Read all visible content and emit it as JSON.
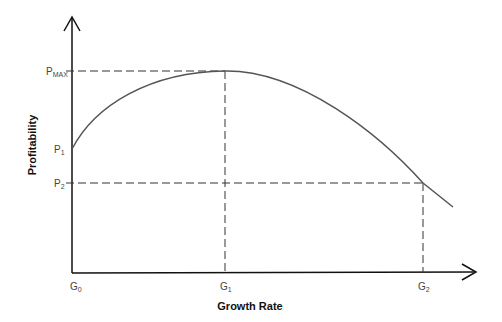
{
  "diagram": {
    "x_axis": {
      "title": "Growth Rate",
      "ticks": [
        {
          "base": "G",
          "sub": "0"
        },
        {
          "base": "G",
          "sub": "1"
        },
        {
          "base": "G",
          "sub": "2"
        }
      ]
    },
    "y_axis": {
      "title": "Profitability",
      "ticks": [
        {
          "base": "P",
          "sub": "MAX"
        },
        {
          "base": "P",
          "sub": "1"
        },
        {
          "base": "P",
          "sub": "2"
        }
      ]
    },
    "colors": {
      "axis": "#111111",
      "curve": "#555555",
      "dash": "#333333"
    }
  }
}
